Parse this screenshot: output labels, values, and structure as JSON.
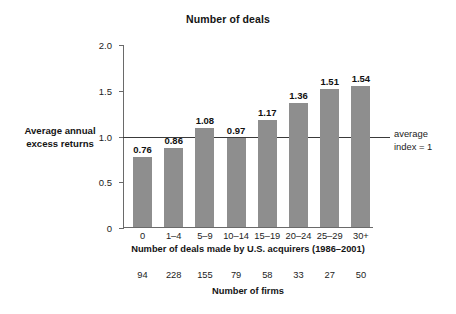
{
  "chart_data": {
    "type": "bar",
    "title": "Number of deals",
    "xlabel": "Number of deals made by U.S. acquirers (1986–2001)",
    "ylabel": "Average annual excess returns",
    "categories": [
      "0",
      "1–4",
      "5–9",
      "10–14",
      "15–19",
      "20–24",
      "25–29",
      "30+"
    ],
    "values": [
      0.76,
      0.86,
      1.08,
      0.97,
      1.17,
      1.36,
      1.51,
      1.54
    ],
    "value_labels": [
      "0.76",
      "0.86",
      "1.08",
      "0.97",
      "1.17",
      "1.36",
      "1.51",
      "1.54"
    ],
    "ylim": [
      0,
      2.0
    ],
    "ytick_labels": [
      "2.0",
      "1.5",
      "1.0",
      "0.5",
      "0"
    ],
    "ytick_values": [
      2.0,
      1.5,
      1.0,
      0.5,
      0
    ],
    "grid": false,
    "legend": "none",
    "bar_color": "#8e8e8e",
    "axis_color": "#6a6a6a",
    "reference_line": {
      "value": 1.0,
      "label_line1": "average",
      "label_line2": "index = 1",
      "color": "#3a3a3a"
    },
    "secondary_axis": {
      "label": "Number of firms",
      "values": [
        94,
        228,
        155,
        79,
        58,
        33,
        27,
        50
      ],
      "value_labels": [
        "94",
        "228",
        "155",
        "79",
        "58",
        "33",
        "27",
        "50"
      ]
    }
  }
}
